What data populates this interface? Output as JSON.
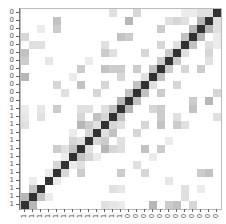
{
  "chart_data": {
    "type": "heatmap",
    "title": "",
    "xlabel": "",
    "ylabel": "",
    "size": 25,
    "x_tick_labels": [
      "1",
      "1",
      "1",
      "1",
      "1",
      "1",
      "1",
      "1",
      "1",
      "1",
      "1",
      "1",
      "1",
      "0",
      "0",
      "0",
      "0",
      "0",
      "0",
      "0",
      "0",
      "0",
      "0",
      "0",
      "0"
    ],
    "y_tick_labels_top_to_bottom": [
      "0",
      "0",
      "0",
      "0",
      "0",
      "0",
      "0",
      "0",
      "0",
      "0",
      "0",
      "0",
      "1",
      "1",
      "1",
      "1",
      "1",
      "1",
      "1",
      "1",
      "1",
      "1",
      "1",
      "1",
      "1"
    ],
    "row_order": "reversed (diagonal runs bottom-left to top-right)",
    "colormap": "greys (white=0, dark=1)",
    "diagonal_value": 1.0,
    "off_diagonal_pairs": [
      [
        0,
        1,
        0.35
      ],
      [
        1,
        2,
        0.3
      ],
      [
        1,
        3,
        0.1
      ],
      [
        0,
        10,
        0.15
      ],
      [
        0,
        11,
        0.12
      ],
      [
        0,
        12,
        0.1
      ],
      [
        3,
        4,
        0.1
      ],
      [
        4,
        5,
        0.2
      ],
      [
        4,
        7,
        0.25
      ],
      [
        5,
        6,
        0.1
      ],
      [
        5,
        7,
        0.15
      ],
      [
        6,
        7,
        0.3
      ],
      [
        6,
        8,
        0.2
      ],
      [
        6,
        9,
        0.1
      ],
      [
        7,
        8,
        0.15
      ],
      [
        7,
        10,
        0.35
      ],
      [
        7,
        11,
        0.2
      ],
      [
        7,
        12,
        0.15
      ],
      [
        8,
        9,
        0.2
      ],
      [
        8,
        10,
        0.25
      ],
      [
        9,
        10,
        0.15
      ],
      [
        9,
        11,
        0.3
      ],
      [
        8,
        12,
        0.15
      ],
      [
        10,
        11,
        0.2
      ],
      [
        10,
        12,
        0.15
      ],
      [
        11,
        12,
        0.3
      ],
      [
        12,
        13,
        0.35
      ],
      [
        13,
        14,
        0.3
      ],
      [
        2,
        11,
        0.15
      ],
      [
        2,
        12,
        0.12
      ],
      [
        4,
        12,
        0.25
      ],
      [
        4,
        15,
        0.2
      ],
      [
        7,
        15,
        0.3
      ],
      [
        7,
        17,
        0.25
      ],
      [
        10,
        15,
        0.2
      ],
      [
        10,
        17,
        0.3
      ],
      [
        11,
        17,
        0.25
      ],
      [
        12,
        17,
        0.25
      ],
      [
        14,
        15,
        0.3
      ],
      [
        15,
        16,
        0.15
      ],
      [
        16,
        17,
        0.3
      ],
      [
        17,
        18,
        0.25
      ],
      [
        18,
        19,
        0.25
      ],
      [
        19,
        20,
        0.15
      ],
      [
        20,
        21,
        0.3
      ],
      [
        21,
        22,
        0.35
      ],
      [
        22,
        23,
        0.35
      ],
      [
        23,
        24,
        0.15
      ],
      [
        0,
        19,
        0.3
      ],
      [
        0,
        16,
        0.35
      ],
      [
        0,
        18,
        0.25
      ],
      [
        0,
        21,
        0.2
      ],
      [
        2,
        20,
        0.15
      ],
      [
        4,
        22,
        0.25
      ],
      [
        4,
        23,
        0.3
      ],
      [
        12,
        21,
        0.3
      ],
      [
        13,
        21,
        0.25
      ],
      [
        13,
        23,
        0.35
      ],
      [
        10,
        19,
        0.25
      ],
      [
        10,
        20,
        0.15
      ],
      [
        11,
        19,
        0.15
      ],
      [
        15,
        19,
        0.2
      ],
      [
        17,
        20,
        0.2
      ],
      [
        17,
        22,
        0.25
      ],
      [
        18,
        23,
        0.15
      ],
      [
        19,
        23,
        0.2
      ],
      [
        20,
        23,
        0.15
      ],
      [
        22,
        24,
        0.15
      ],
      [
        14,
        24,
        0.2
      ],
      [
        11,
        24,
        0.15
      ],
      [
        6,
        16,
        0.1
      ],
      [
        8,
        18,
        0.1
      ],
      [
        3,
        18,
        0.12
      ],
      [
        1,
        20,
        0.15
      ],
      [
        2,
        22,
        0.1
      ],
      [
        24,
        20,
        0.1
      ],
      [
        21,
        24,
        0.1
      ],
      [
        9,
        14,
        0.2
      ],
      [
        5,
        14,
        0.15
      ],
      [
        12,
        16,
        0.2
      ],
      [
        14,
        17,
        0.25
      ]
    ]
  }
}
